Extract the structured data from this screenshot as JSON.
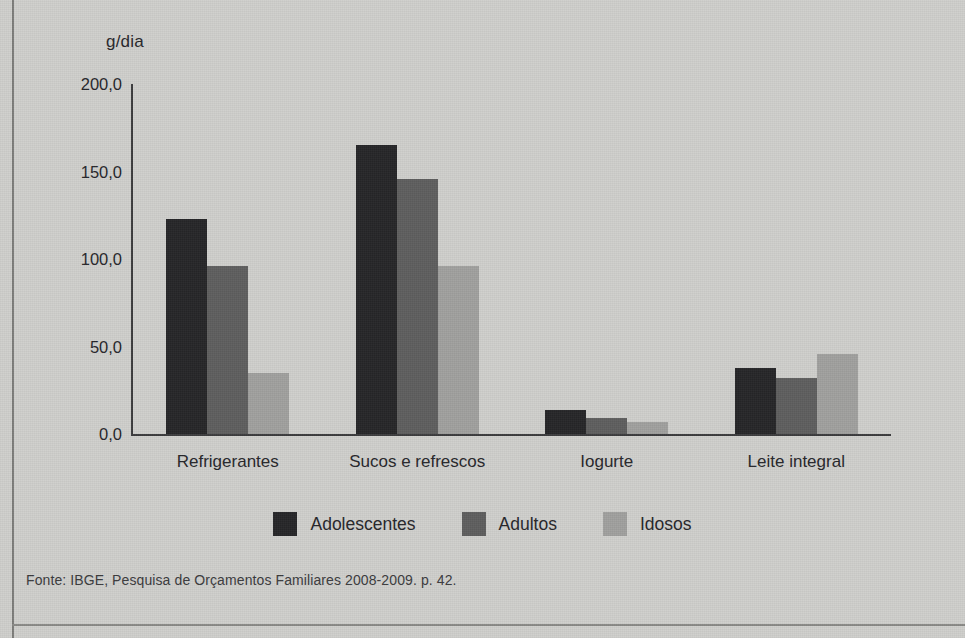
{
  "chart_data": {
    "type": "bar",
    "title": "",
    "subtitle": "",
    "xlabel": "",
    "ylabel": "g/dia",
    "ylim": [
      0,
      200
    ],
    "yticks": [
      "0,0",
      "50,0",
      "100,0",
      "150,0",
      "200,0"
    ],
    "ytick_values": [
      0,
      50,
      100,
      150,
      200
    ],
    "grid": false,
    "legend_position": "bottom",
    "categories": [
      "Refrigerantes",
      "Sucos e refrescos",
      "Iogurte",
      "Leite integral"
    ],
    "series": [
      {
        "name": "Adolescentes",
        "color": "#262628",
        "values": [
          123,
          165,
          14,
          38
        ]
      },
      {
        "name": "Adultos",
        "color": "#5e5e5e",
        "values": [
          96,
          146,
          9,
          32
        ]
      },
      {
        "name": "Idosos",
        "color": "#a0a09e",
        "values": [
          35,
          96,
          7,
          46
        ]
      }
    ],
    "annotations": []
  },
  "axis": {
    "y_title": "g/dia",
    "y_ticks": [
      "200,0",
      "150,0",
      "100,0",
      "50,0",
      "0,0"
    ],
    "x_labels": [
      "Refrigerantes",
      "Sucos e refrescos",
      "Iogurte",
      "Leite integral"
    ]
  },
  "legend": {
    "items": [
      {
        "label": "Adolescentes",
        "color": "#262628"
      },
      {
        "label": "Adultos",
        "color": "#5e5e5e"
      },
      {
        "label": "Idosos",
        "color": "#a0a09e"
      }
    ]
  },
  "source": {
    "text": "Fonte: IBGE, Pesquisa de Orçamentos Familiares 2008-2009. p. 42."
  },
  "colors": {
    "background": "#cfcfcc",
    "axis": "#3b3b3d",
    "text": "#26262a",
    "series_adolescentes": "#262628",
    "series_adultos": "#5e5e5e",
    "series_idosos": "#a0a09e"
  }
}
